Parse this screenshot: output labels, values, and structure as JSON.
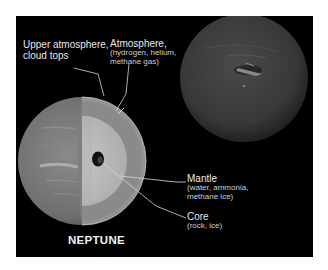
{
  "diagram": {
    "title": "NEPTUNE",
    "labels": {
      "upper_atmosphere": {
        "line1": "Upper atmosphere,",
        "line2": "cloud tops"
      },
      "atmosphere": {
        "title": "Atmosphere,",
        "line1": "(hydrogen, helium,",
        "line2": "methane gas)"
      },
      "mantle": {
        "title": "Mantle",
        "line1": "(water, ammonia,",
        "line2": "methane ice)"
      },
      "core": {
        "title": "Core",
        "line1": "(rock, ice)"
      }
    },
    "colors": {
      "background": "#000000",
      "page": "#ffffff",
      "planet_photo": "#3c3c3c",
      "planet_cutaway": "#7a7a7a",
      "atmosphere_layer": "#9a9a9a",
      "mantle_layer": "#c4c4c4",
      "core": "#111111",
      "text": "#e8e8e8"
    }
  }
}
